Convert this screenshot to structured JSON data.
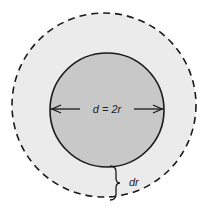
{
  "diagram": {
    "type": "geometry",
    "colors": {
      "background": "#ffffff",
      "outer_fill": "#ebebeb",
      "inner_fill": "#c8c8c8",
      "stroke": "#1a1a1a"
    },
    "outer_circle": {
      "style": "dashed",
      "cx": 104,
      "cy": 105,
      "r": 92
    },
    "inner_circle": {
      "style": "solid",
      "cx": 107,
      "cy": 110,
      "r": 57
    },
    "diameter_label": "d = 2r",
    "thickness_label": "dr"
  }
}
